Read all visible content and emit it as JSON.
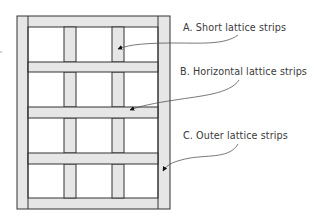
{
  "diagram": {
    "type": "lattice-frame",
    "colors": {
      "strip_fill": "#e6e6e6",
      "cell_fill": "#ffffff",
      "line": "#333333",
      "label_text": "#3a3a3a",
      "leader": "#555555"
    },
    "frame": {
      "outer": [
        17,
        16,
        170,
        209
      ],
      "inner": [
        28,
        27,
        158,
        198
      ]
    },
    "vertical_strips": [
      {
        "x0": 64,
        "x1": 76
      },
      {
        "x0": 112,
        "x1": 124
      }
    ],
    "horizontal_strips": [
      {
        "y0": 62,
        "y1": 72
      },
      {
        "y0": 107,
        "y1": 118
      },
      {
        "y0": 153,
        "y1": 164
      }
    ],
    "labels": [
      {
        "id": "A",
        "text": "A. Short lattice strips"
      },
      {
        "id": "B",
        "text": "B. Horizontal lattice strips"
      },
      {
        "id": "C",
        "text": "C. Outer lattice strips"
      }
    ]
  }
}
